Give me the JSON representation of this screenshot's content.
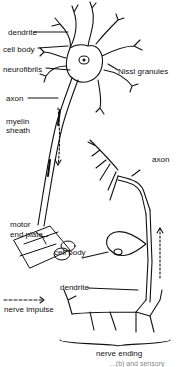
{
  "diagram": {
    "labels": {
      "dendrite_top": "dendrite",
      "cell_body_top": "cell body",
      "neurofibrils": "neurofibrils",
      "nissl": "Nissl granules",
      "axon_left": "axon",
      "myelin_1": "myelin",
      "myelin_2": "sheath",
      "axon_right": "axon",
      "motor_1": "motor",
      "motor_2": "end plate",
      "cell_body_bottom": "cell body",
      "dendrite_bottom": "dendrite",
      "nerve_impulse": "nerve impulse",
      "nerve_ending": "nerve ending"
    },
    "caption_fragment": "...(b) and sensory"
  }
}
